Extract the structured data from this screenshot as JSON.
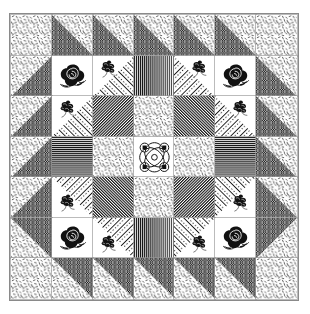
{
  "artwork": {
    "title": "Patchwork quilt block photograph",
    "medium": "black and white printed quilt diagram",
    "grid_rows": 7,
    "grid_columns": 7,
    "background_color": "#ffffff",
    "ink_color": "#111111",
    "frame_color": "#8a8a8a"
  },
  "legend": {
    "fabrics": [
      {
        "key": "confetti",
        "label": "confetti dash print"
      },
      {
        "key": "lattice",
        "label": "black lattice weave print"
      },
      {
        "key": "rose",
        "label": "black rose floral motif"
      },
      {
        "key": "posy",
        "label": "small dark posy motif"
      },
      {
        "key": "dotstripe",
        "label": "dotted diagonal stripe"
      },
      {
        "key": "vstripe",
        "label": "vertical stripe"
      },
      {
        "key": "hstripe",
        "label": "horizontal stripe"
      },
      {
        "key": "dstripe",
        "label": "diagonal stripe"
      },
      {
        "key": "medallion",
        "label": "ornate scroll medallion"
      }
    ]
  },
  "cells": [
    {
      "r": 1,
      "c": 1,
      "name": "cell-r1c1",
      "type": "confetti",
      "desc": "confetti dash print square"
    },
    {
      "r": 1,
      "c": 2,
      "name": "cell-r1c2",
      "type": "hst-bl",
      "desc": "half square triangle, lattice lower left"
    },
    {
      "r": 1,
      "c": 3,
      "name": "cell-r1c3",
      "type": "hst-bl",
      "desc": "half square triangle, lattice lower left"
    },
    {
      "r": 1,
      "c": 4,
      "name": "cell-r1c4",
      "type": "hst-bl",
      "desc": "half square triangle, lattice lower left"
    },
    {
      "r": 1,
      "c": 5,
      "name": "cell-r1c5",
      "type": "hst-bl",
      "desc": "half square triangle, lattice lower left"
    },
    {
      "r": 1,
      "c": 6,
      "name": "cell-r1c6",
      "type": "hst-bl",
      "desc": "half square triangle, lattice lower left"
    },
    {
      "r": 1,
      "c": 7,
      "name": "cell-r1c7",
      "type": "confetti",
      "desc": "confetti dash print square"
    },
    {
      "r": 2,
      "c": 1,
      "name": "cell-r2c1",
      "type": "hst-br",
      "desc": "half square triangle, lattice lower right"
    },
    {
      "r": 2,
      "c": 2,
      "name": "cell-r2c2",
      "type": "rose",
      "desc": "black rose motif on white"
    },
    {
      "r": 2,
      "c": 3,
      "name": "cell-r2c3",
      "type": "posy-dots-br",
      "desc": "posy motif with dotted diagonal stripe triangle lower right"
    },
    {
      "r": 2,
      "c": 4,
      "name": "cell-r2c4",
      "type": "vstripe",
      "desc": "vertical stripe square"
    },
    {
      "r": 2,
      "c": 5,
      "name": "cell-r2c5",
      "type": "posy-dots-bl",
      "desc": "posy motif with dotted diagonal stripe triangle lower left"
    },
    {
      "r": 2,
      "c": 6,
      "name": "cell-r2c6",
      "type": "rose",
      "desc": "black rose motif on white"
    },
    {
      "r": 2,
      "c": 7,
      "name": "cell-r2c7",
      "type": "hst-bl",
      "desc": "half square triangle, lattice lower left"
    },
    {
      "r": 3,
      "c": 1,
      "name": "cell-r3c1",
      "type": "hst-br",
      "desc": "half square triangle, lattice lower right"
    },
    {
      "r": 3,
      "c": 2,
      "name": "cell-r3c2",
      "type": "posy-dots-br",
      "desc": "posy motif with dotted diagonal stripe triangle lower right"
    },
    {
      "r": 3,
      "c": 3,
      "name": "cell-r3c3",
      "type": "dstripe",
      "desc": "diagonal stripe square"
    },
    {
      "r": 3,
      "c": 4,
      "name": "cell-r3c4",
      "type": "confetti",
      "desc": "confetti dash print square"
    },
    {
      "r": 3,
      "c": 5,
      "name": "cell-r3c5",
      "type": "dstripe-rev",
      "desc": "diagonal stripe square, reversed"
    },
    {
      "r": 3,
      "c": 6,
      "name": "cell-r3c6",
      "type": "posy-dots-bl",
      "desc": "posy motif with dotted diagonal stripe triangle lower left"
    },
    {
      "r": 3,
      "c": 7,
      "name": "cell-r3c7",
      "type": "hst-bl",
      "desc": "half square triangle, lattice lower left"
    },
    {
      "r": 4,
      "c": 1,
      "name": "cell-r4c1",
      "type": "hst-br",
      "desc": "half square triangle, lattice lower right"
    },
    {
      "r": 4,
      "c": 2,
      "name": "cell-r4c2",
      "type": "hstripe",
      "desc": "horizontal stripe square"
    },
    {
      "r": 4,
      "c": 3,
      "name": "cell-r4c3",
      "type": "confetti",
      "desc": "confetti dash print square"
    },
    {
      "r": 4,
      "c": 4,
      "name": "cell-r4c4",
      "type": "medallion",
      "desc": "ornate scroll medallion centre block"
    },
    {
      "r": 4,
      "c": 5,
      "name": "cell-r4c5",
      "type": "confetti",
      "desc": "confetti dash print square"
    },
    {
      "r": 4,
      "c": 6,
      "name": "cell-r4c6",
      "type": "hstripe",
      "desc": "horizontal stripe square"
    },
    {
      "r": 4,
      "c": 7,
      "name": "cell-r4c7",
      "type": "hst-bl",
      "desc": "half square triangle, lattice lower left"
    },
    {
      "r": 5,
      "c": 1,
      "name": "cell-r5c1",
      "type": "hst-br",
      "desc": "half square triangle, lattice lower right"
    },
    {
      "r": 5,
      "c": 2,
      "name": "cell-r5c2",
      "type": "posy-dots-tr",
      "desc": "posy motif with dotted diagonal stripe triangle upper right"
    },
    {
      "r": 5,
      "c": 3,
      "name": "cell-r5c3",
      "type": "dstripe-rev",
      "desc": "diagonal stripe square, reversed"
    },
    {
      "r": 5,
      "c": 4,
      "name": "cell-r5c4",
      "type": "confetti",
      "desc": "confetti dash print square"
    },
    {
      "r": 5,
      "c": 5,
      "name": "cell-r5c5",
      "type": "dstripe",
      "desc": "diagonal stripe square"
    },
    {
      "r": 5,
      "c": 6,
      "name": "cell-r5c6",
      "type": "posy-dots-tl",
      "desc": "posy motif with dotted diagonal stripe triangle upper left"
    },
    {
      "r": 5,
      "c": 7,
      "name": "cell-r5c7",
      "type": "hst-bl",
      "desc": "half square triangle, lattice lower left"
    },
    {
      "r": 6,
      "c": 1,
      "name": "cell-r6c1",
      "type": "hst-tr",
      "desc": "half square triangle, lattice upper right"
    },
    {
      "r": 6,
      "c": 2,
      "name": "cell-r6c2",
      "type": "rose",
      "desc": "black rose motif on white"
    },
    {
      "r": 6,
      "c": 3,
      "name": "cell-r6c3",
      "type": "posy-dots-tr",
      "desc": "posy motif with dotted diagonal stripe triangle upper right"
    },
    {
      "r": 6,
      "c": 4,
      "name": "cell-r6c4",
      "type": "vstripe",
      "desc": "vertical stripe square"
    },
    {
      "r": 6,
      "c": 5,
      "name": "cell-r6c5",
      "type": "posy-dots-tl",
      "desc": "posy motif with dotted diagonal stripe triangle upper left"
    },
    {
      "r": 6,
      "c": 6,
      "name": "cell-r6c6",
      "type": "rose",
      "desc": "black rose motif on white"
    },
    {
      "r": 6,
      "c": 7,
      "name": "cell-r6c7",
      "type": "hst-tl",
      "desc": "half square triangle, lattice upper left"
    },
    {
      "r": 7,
      "c": 1,
      "name": "cell-r7c1",
      "type": "confetti",
      "desc": "confetti dash print square"
    },
    {
      "r": 7,
      "c": 2,
      "name": "cell-r7c2",
      "type": "hst-tr",
      "desc": "half square triangle, lattice upper right"
    },
    {
      "r": 7,
      "c": 3,
      "name": "cell-r7c3",
      "type": "hst-tr",
      "desc": "half square triangle, lattice upper right"
    },
    {
      "r": 7,
      "c": 4,
      "name": "cell-r7c4",
      "type": "hst-tr",
      "desc": "half square triangle, lattice upper right"
    },
    {
      "r": 7,
      "c": 5,
      "name": "cell-r7c5",
      "type": "hst-tr",
      "desc": "half square triangle, lattice upper right"
    },
    {
      "r": 7,
      "c": 6,
      "name": "cell-r7c6",
      "type": "hst-tr",
      "desc": "half square triangle, lattice upper right"
    },
    {
      "r": 7,
      "c": 7,
      "name": "cell-r7c7",
      "type": "confetti",
      "desc": "confetti dash print square"
    }
  ]
}
